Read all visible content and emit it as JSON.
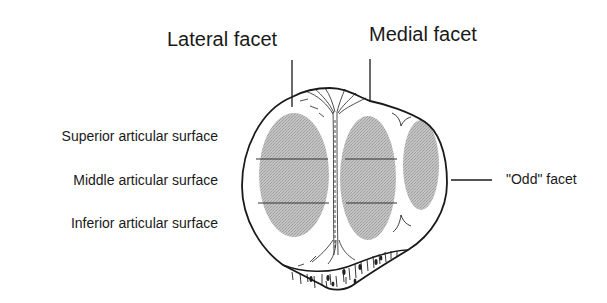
{
  "diagram": {
    "labels": {
      "lateral_facet": "Lateral facet",
      "medial_facet": "Medial facet",
      "superior": "Superior articular surface",
      "middle": "Middle articular surface",
      "inferior": "Inferior articular surface",
      "odd_facet": "\"Odd\" facet"
    },
    "colors": {
      "outline": "#1a1a1a",
      "facet_fill": "#b9b9b9",
      "background": "#ffffff"
    }
  }
}
